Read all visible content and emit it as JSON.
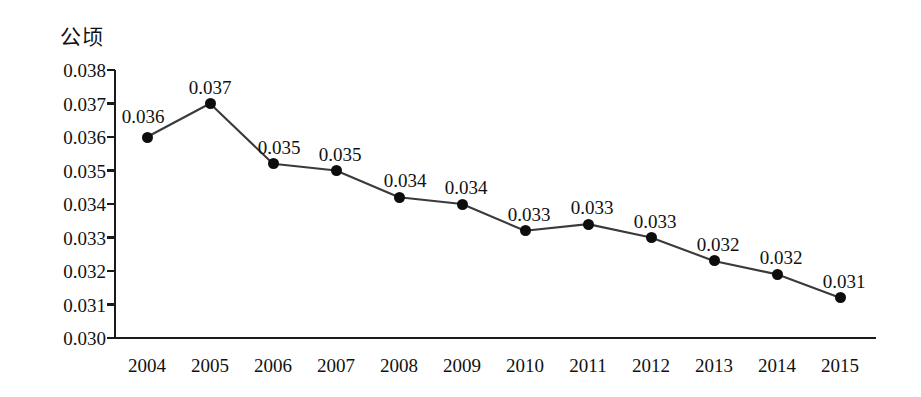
{
  "chart_data": {
    "type": "line",
    "title": "",
    "unit_label": "公顷",
    "xlabel": "",
    "ylabel": "公顷",
    "categories": [
      "2004",
      "2005",
      "2006",
      "2007",
      "2008",
      "2009",
      "2010",
      "2011",
      "2012",
      "2013",
      "2014",
      "2015"
    ],
    "values": [
      0.036,
      0.037,
      0.0352,
      0.035,
      0.0342,
      0.034,
      0.0332,
      0.0334,
      0.033,
      0.0323,
      0.0319,
      0.0312
    ],
    "point_labels": [
      "0.036",
      "0.037",
      "0.035",
      "0.035",
      "0.034",
      "0.034",
      "0.033",
      "0.033",
      "0.033",
      "0.032",
      "0.032",
      "0.031"
    ],
    "y_ticks": [
      "0.038",
      "0.037",
      "0.036",
      "0.035",
      "0.034",
      "0.033",
      "0.032",
      "0.031",
      "0.030"
    ],
    "y_tick_values": [
      0.038,
      0.037,
      0.036,
      0.035,
      0.034,
      0.033,
      0.032,
      0.031,
      0.03
    ],
    "ylim": [
      0.03,
      0.038
    ],
    "grid": false,
    "legend": "none",
    "marker": "filled-circle",
    "line_color": "#3a3a3a",
    "marker_color": "#0d0d0d",
    "axis_color": "#1a1a1a"
  }
}
